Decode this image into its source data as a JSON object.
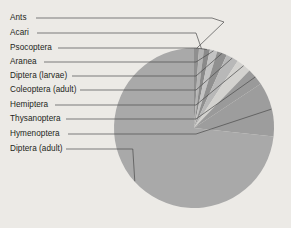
{
  "figure": {
    "background_color": "#eceae6",
    "width": 291,
    "height": 228
  },
  "chart_data": {
    "type": "pie",
    "title": "",
    "subtitle": "",
    "xlabel": "",
    "ylabel": "",
    "legend_position": "none",
    "labels_position": "outside-left-with-leader-lines",
    "grid": false,
    "start_angle_deg": 90,
    "direction": "clockwise",
    "center": {
      "x": 194,
      "y": 128
    },
    "radius": 80,
    "categories": [
      "Ants",
      "Acari",
      "Psocoptera",
      "Aranea",
      "Diptera (larvae)",
      "Coleoptera (adult)",
      "Hemiptera",
      "Thysanoptera",
      "Hymenoptera",
      "Diptera (adult)"
    ],
    "values": [
      1.0,
      1.0,
      1.2,
      1.5,
      2.0,
      2.5,
      3.0,
      3.5,
      11.0,
      73.3
    ],
    "units": "percent",
    "colors": [
      "#8f8f8f",
      "#b4b4b4",
      "#8a8a8a",
      "#c3c3c3",
      "#909090",
      "#b8b8b8",
      "#d3d2cf",
      "#9a9a9a",
      "#9d9d9d",
      "#a9a9a9"
    ],
    "slices": [
      {
        "label": "Ants",
        "value": 1.0,
        "color": "#8f8f8f",
        "label_y": 18
      },
      {
        "label": "Acari",
        "value": 1.0,
        "color": "#b4b4b4",
        "label_y": 33
      },
      {
        "label": "Psocoptera",
        "value": 1.2,
        "color": "#8a8a8a",
        "label_y": 48
      },
      {
        "label": "Aranea",
        "value": 1.5,
        "color": "#c3c3c3",
        "label_y": 62
      },
      {
        "label": "Diptera (larvae)",
        "value": 2.0,
        "color": "#909090",
        "label_y": 76
      },
      {
        "label": "Coleoptera (adult)",
        "value": 2.5,
        "color": "#b8b8b8",
        "label_y": 90
      },
      {
        "label": "Hemiptera",
        "value": 3.0,
        "color": "#d3d2cf",
        "label_y": 105
      },
      {
        "label": "Thysanoptera",
        "value": 3.5,
        "color": "#9a9a9a",
        "label_y": 119
      },
      {
        "label": "Hymenoptera",
        "value": 11.0,
        "color": "#9d9d9d",
        "label_y": 134
      },
      {
        "label": "Diptera (adult)",
        "value": 73.3,
        "color": "#a9a9a9",
        "label_y": 149
      }
    ]
  }
}
